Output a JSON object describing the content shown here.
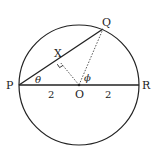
{
  "diagram": {
    "type": "geometry-circle",
    "center": {
      "label": "O",
      "x": 79,
      "y": 85
    },
    "radius": 60,
    "points": {
      "P": {
        "label": "P",
        "x": 19,
        "y": 85
      },
      "R": {
        "label": "R",
        "x": 139,
        "y": 85
      },
      "Q": {
        "label": "Q",
        "x": 103,
        "y": 29
      },
      "X": {
        "label": "X",
        "x": 60,
        "y": 62
      }
    },
    "angles": {
      "theta": "θ",
      "phi": "ϕ"
    },
    "lengths": {
      "PO": "2",
      "OR": "2"
    },
    "colors": {
      "stroke": "#222222",
      "background": "#ffffff"
    }
  }
}
